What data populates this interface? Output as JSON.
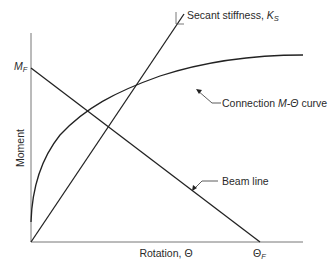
{
  "diagram": {
    "axes": {
      "y_label": "Moment",
      "x_label": "Rotation, Θ",
      "y_tick": {
        "main": "M",
        "sub": "F"
      },
      "x_tick": {
        "main": "Θ",
        "sub": "F"
      }
    },
    "labels": {
      "secant": {
        "text": "Secant stiffness, ",
        "symbol": "K",
        "sub": "S"
      },
      "connection": {
        "prefix": "Connection ",
        "symbol": "M-Θ",
        "suffix": " curve"
      },
      "beam_line": "Beam line"
    },
    "elements": [
      {
        "name": "beam-line",
        "from": "M_F on moment axis",
        "to": "Θ_F on rotation axis",
        "type": "straight line"
      },
      {
        "name": "secant-stiffness-line",
        "from": "origin",
        "type": "straight line",
        "slope": "K_S"
      },
      {
        "name": "connection-m-theta-curve",
        "type": "nonlinear curve",
        "shape": "concave, flattening"
      }
    ],
    "colors": {
      "line": "#222222",
      "text": "#2a2a2a",
      "background": "#ffffff"
    }
  }
}
